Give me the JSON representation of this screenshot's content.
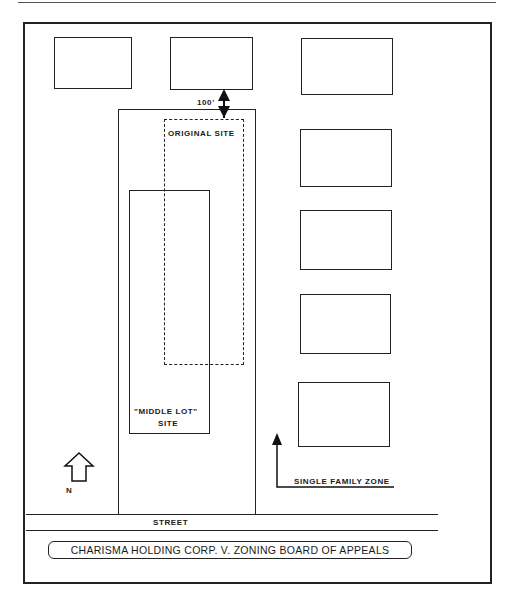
{
  "diagram": {
    "title": "CHARISMA HOLDING CORP. V. ZONING BOARD OF APPEALS",
    "labels": {
      "distance": "100'",
      "original_site": "ORIGINAL SITE",
      "middle_lot_line1": "\"MIDDLE LOT\"",
      "middle_lot_line2": "SITE",
      "north": "N",
      "single_family_zone": "SINGLE FAMILY ZONE",
      "street": "STREET"
    },
    "buildings": [
      {
        "name": "top-left"
      },
      {
        "name": "top-middle"
      },
      {
        "name": "right-1"
      },
      {
        "name": "right-2"
      },
      {
        "name": "right-3"
      },
      {
        "name": "right-4"
      },
      {
        "name": "right-5"
      }
    ]
  }
}
